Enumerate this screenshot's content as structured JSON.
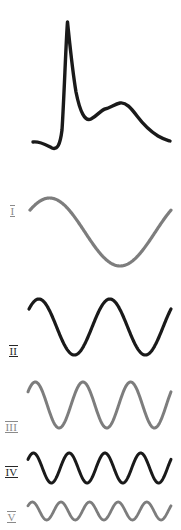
{
  "figure": {
    "width": 181,
    "height": 530,
    "background_color": "#ffffff",
    "colors": {
      "dark_trace": "#1a1a1a",
      "gray_trace": "#7d7d7d",
      "dark_label": "#262626",
      "gray_label": "#8a8a8a"
    }
  },
  "composite": {
    "name": "composite-waveform",
    "color": "#1a1a1a",
    "stroke_width": 3.4,
    "description": "Sharp primary peak followed by a trough and a smaller secondary bump with a long decaying tail",
    "path": "M 33 142 C 40 141 46 145 52 148 C 57 150 60 146 62 130 C 64 100 66 40 67.5 22 C 69 36 72 68 76 92 C 80 112 85 122 91 119 C 97 116 101 110 105 109 C 110 108 115 104 120 103 C 126 102 131 108 137 116 C 143 124 150 131 158 136 C 163 139 167 140 170 141"
  },
  "harmonics": [
    {
      "label": "I",
      "name": "harmonic-1",
      "cycles": 1,
      "color": "#7d7d7d",
      "label_color": "#8a8a8a",
      "stroke_width": 3.2,
      "amplitude": 34,
      "phase_deg": 40,
      "band_top": 178,
      "band_height": 108,
      "baseline": 54,
      "x_start": 30,
      "x_end": 171,
      "label_x": 10,
      "label_y": 202
    },
    {
      "label": "II",
      "name": "harmonic-2",
      "cycles": 2,
      "color": "#1a1a1a",
      "label_color": "#262626",
      "stroke_width": 3.2,
      "amplitude": 28,
      "phase_deg": 40,
      "band_top": 286,
      "band_height": 82,
      "baseline": 41,
      "x_start": 29,
      "x_end": 171,
      "label_x": 9,
      "label_y": 342
    },
    {
      "label": "III",
      "name": "harmonic-3",
      "cycles": 3,
      "color": "#7d7d7d",
      "label_color": "#8a8a8a",
      "stroke_width": 3.0,
      "amplitude": 23,
      "phase_deg": 35,
      "band_top": 372,
      "band_height": 66,
      "baseline": 33,
      "x_start": 28,
      "x_end": 171,
      "label_x": 5,
      "label_y": 418
    },
    {
      "label": "IV",
      "name": "harmonic-4",
      "cycles": 4,
      "color": "#1a1a1a",
      "label_color": "#262626",
      "stroke_width": 3.0,
      "amplitude": 15,
      "phase_deg": 35,
      "band_top": 444,
      "band_height": 48,
      "baseline": 24,
      "x_start": 28,
      "x_end": 171,
      "label_x": 5,
      "label_y": 463
    },
    {
      "label": "V",
      "name": "harmonic-5",
      "cycles": 5,
      "color": "#7d7d7d",
      "label_color": "#8a8a8a",
      "stroke_width": 2.8,
      "amplitude": 9,
      "phase_deg": 35,
      "band_top": 492,
      "band_height": 38,
      "baseline": 19,
      "x_start": 28,
      "x_end": 171,
      "label_x": 7,
      "label_y": 508
    }
  ]
}
